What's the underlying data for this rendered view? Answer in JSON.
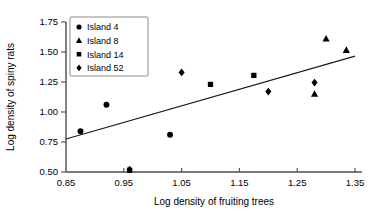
{
  "chart_data": {
    "type": "scatter",
    "title": "",
    "xlabel": "Log density of fruiting trees",
    "ylabel": "Log density of spiny rats",
    "xlim": [
      0.85,
      1.35
    ],
    "ylim": [
      0.5,
      1.75
    ],
    "xticks": [
      "0.85",
      "0.95",
      "1.05",
      "1.15",
      "1.25",
      "1.35"
    ],
    "xtick_values": [
      0.85,
      0.95,
      1.05,
      1.15,
      1.25,
      1.35
    ],
    "yticks": [
      "0.50",
      "0.75",
      "1.00",
      "1.25",
      "1.50",
      "1.75"
    ],
    "ytick_values": [
      0.5,
      0.75,
      1.0,
      1.25,
      1.5,
      1.75
    ],
    "grid": false,
    "legend_position": "top-left",
    "marker_color": "#000000",
    "series": [
      {
        "name": "Island 4",
        "marker": "circle",
        "points": [
          {
            "x": 0.875,
            "y": 0.84
          },
          {
            "x": 0.92,
            "y": 1.06
          },
          {
            "x": 1.03,
            "y": 0.81
          }
        ]
      },
      {
        "name": "Island 8",
        "marker": "triangle",
        "points": [
          {
            "x": 1.3,
            "y": 1.61
          },
          {
            "x": 1.335,
            "y": 1.515
          },
          {
            "x": 1.28,
            "y": 1.15
          }
        ]
      },
      {
        "name": "Island 14",
        "marker": "square",
        "points": [
          {
            "x": 1.1,
            "y": 1.23
          },
          {
            "x": 1.175,
            "y": 1.305
          },
          {
            "x": 0.96,
            "y": 0.515
          }
        ]
      },
      {
        "name": "Island 52",
        "marker": "diamond",
        "points": [
          {
            "x": 1.05,
            "y": 1.33
          },
          {
            "x": 1.2,
            "y": 1.17
          },
          {
            "x": 1.28,
            "y": 1.245
          },
          {
            "x": 0.96,
            "y": 0.52
          }
        ]
      }
    ],
    "trendline": {
      "type": "line",
      "x0": 0.85,
      "y0": 0.775,
      "x1": 1.35,
      "y1": 1.465
    }
  }
}
